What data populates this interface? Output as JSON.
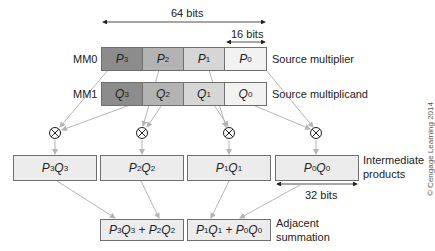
{
  "dimensions": {
    "width_total": "64 bits",
    "width_element": "16 bits",
    "width_product": "32 bits"
  },
  "registers": [
    {
      "name": "MM0",
      "description": "Source multiplier",
      "cells": [
        {
          "base": "P",
          "sub": "3",
          "color": "#8c8c8c"
        },
        {
          "base": "P",
          "sub": "2",
          "color": "#b3b3b3"
        },
        {
          "base": "P",
          "sub": "1",
          "color": "#d6d6d6"
        },
        {
          "base": "P",
          "sub": "0",
          "color": "#f2f2f2"
        }
      ]
    },
    {
      "name": "MM1",
      "description": "Source multiplicand",
      "cells": [
        {
          "base": "Q",
          "sub": "3",
          "color": "#8c8c8c"
        },
        {
          "base": "Q",
          "sub": "2",
          "color": "#b3b3b3"
        },
        {
          "base": "Q",
          "sub": "1",
          "color": "#d6d6d6"
        },
        {
          "base": "Q",
          "sub": "0",
          "color": "#f2f2f2"
        }
      ]
    }
  ],
  "operator_symbol": "⊗",
  "intermediate": {
    "label_line1": "Intermediate",
    "label_line2": "products",
    "products": [
      {
        "p": "3",
        "q": "3"
      },
      {
        "p": "2",
        "q": "2"
      },
      {
        "p": "1",
        "q": "1"
      },
      {
        "p": "0",
        "q": "0"
      }
    ]
  },
  "summation": {
    "label_line1": "Adjacent",
    "label_line2": "summation",
    "sums": [
      {
        "a_p": "3",
        "a_q": "3",
        "b_p": "2",
        "b_q": "2"
      },
      {
        "a_p": "1",
        "a_q": "1",
        "b_p": "0",
        "b_q": "0"
      }
    ],
    "plus": "+"
  },
  "copyright": "© Cengage Learning 2014",
  "colors": {
    "arrow": "#b5b5b5",
    "dim_arrow": "#222222",
    "box_fill": "#ececec",
    "border": "#6f6f6f"
  }
}
